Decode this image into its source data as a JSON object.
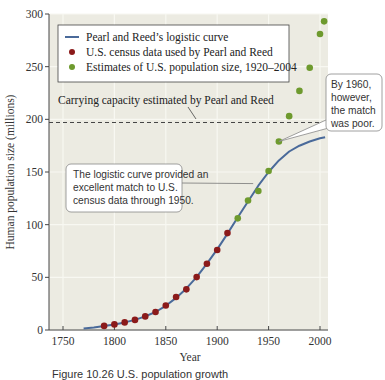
{
  "chart_data": {
    "type": "scatter",
    "title": "",
    "xlabel": "Year",
    "ylabel": "Human population size (millions)",
    "xlim": [
      1740,
      2010
    ],
    "ylim": [
      0,
      300
    ],
    "xticks": [
      1750,
      1800,
      1850,
      1900,
      1950,
      2000
    ],
    "yticks": [
      0,
      50,
      100,
      150,
      200,
      250,
      300
    ],
    "grid": true,
    "legend_position": "upper-left",
    "legend": [
      "Pearl and Reed’s logistic curve",
      "U.S. census data used by Pearl and Reed",
      "Estimates of U.S. population size, 1920–2004"
    ],
    "carrying_capacity": {
      "value": 197,
      "label": "Carrying capacity estimated by Pearl and Reed"
    },
    "series": [
      {
        "name": "Pearl and Reed’s logistic curve",
        "kind": "line",
        "color": "#4a6a9a",
        "x": [
          1770,
          1780,
          1790,
          1800,
          1810,
          1820,
          1830,
          1840,
          1850,
          1860,
          1870,
          1880,
          1890,
          1900,
          1910,
          1920,
          1930,
          1940,
          1950,
          1960,
          1970,
          1980,
          1990,
          2000,
          2005
        ],
        "values": [
          1.5,
          2.5,
          3.9,
          5.3,
          7.2,
          9.6,
          12.9,
          17.1,
          23.0,
          30.5,
          39.5,
          50.2,
          62.9,
          76.5,
          91.5,
          107,
          122,
          137,
          150,
          161,
          169.5,
          175,
          179,
          182,
          183
        ]
      },
      {
        "name": "U.S. census data used by Pearl and Reed",
        "kind": "scatter",
        "color": "#8b1a1a",
        "x": [
          1790,
          1800,
          1810,
          1820,
          1830,
          1840,
          1850,
          1860,
          1870,
          1880,
          1890,
          1900,
          1910
        ],
        "values": [
          3.9,
          5.3,
          7.2,
          9.6,
          12.9,
          17.1,
          23.2,
          31.4,
          38.6,
          50.2,
          62.9,
          76.0,
          92.0
        ]
      },
      {
        "name": "Estimates of U.S. population size, 1920–2004",
        "kind": "scatter",
        "color": "#6e9a2e",
        "x": [
          1920,
          1930,
          1940,
          1950,
          1960,
          1970,
          1980,
          1990,
          2000,
          2004
        ],
        "values": [
          106,
          123,
          132,
          151,
          179,
          203,
          227,
          249,
          281,
          293
        ]
      }
    ],
    "annotations": [
      {
        "text_lines": [
          "The logistic curve provided an",
          "excellent match to U.S.",
          "census data through 1950."
        ],
        "points_to": [
          1935,
          139
        ]
      },
      {
        "text_lines": [
          "By 1960,",
          "however,",
          "the match",
          "was poor."
        ],
        "points_to": [
          1960,
          179
        ]
      }
    ]
  },
  "caption": "Figure 10.26  U.S. population growth"
}
